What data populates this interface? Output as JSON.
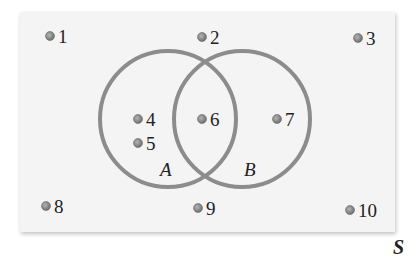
{
  "diagram": {
    "type": "venn",
    "universe": {
      "label": "S",
      "x": 20,
      "y": 12,
      "width": 375,
      "height": 220,
      "fill": "#f4f4f4"
    },
    "sets": [
      {
        "label": "A",
        "cx": 168,
        "cy": 119,
        "r": 68,
        "label_x": 160,
        "label_y": 176
      },
      {
        "label": "B",
        "cx": 242,
        "cy": 119,
        "r": 68,
        "label_x": 244,
        "label_y": 176
      }
    ],
    "stroke_color": "#8c8c8c",
    "dot_color": "#8a8a8a",
    "points": [
      {
        "label": "1",
        "x": 50,
        "y": 36
      },
      {
        "label": "2",
        "x": 202,
        "y": 37
      },
      {
        "label": "3",
        "x": 358,
        "y": 38
      },
      {
        "label": "4",
        "x": 138,
        "y": 119
      },
      {
        "label": "5",
        "x": 138,
        "y": 143
      },
      {
        "label": "6",
        "x": 202,
        "y": 119
      },
      {
        "label": "7",
        "x": 277,
        "y": 119
      },
      {
        "label": "8",
        "x": 46,
        "y": 206
      },
      {
        "label": "9",
        "x": 198,
        "y": 208
      },
      {
        "label": "10",
        "x": 350,
        "y": 210
      }
    ],
    "membership": {
      "A_only": [
        "4",
        "5"
      ],
      "A_and_B": [
        "6"
      ],
      "B_only": [
        "7"
      ],
      "neither": [
        "1",
        "2",
        "3",
        "8",
        "9",
        "10"
      ]
    }
  }
}
